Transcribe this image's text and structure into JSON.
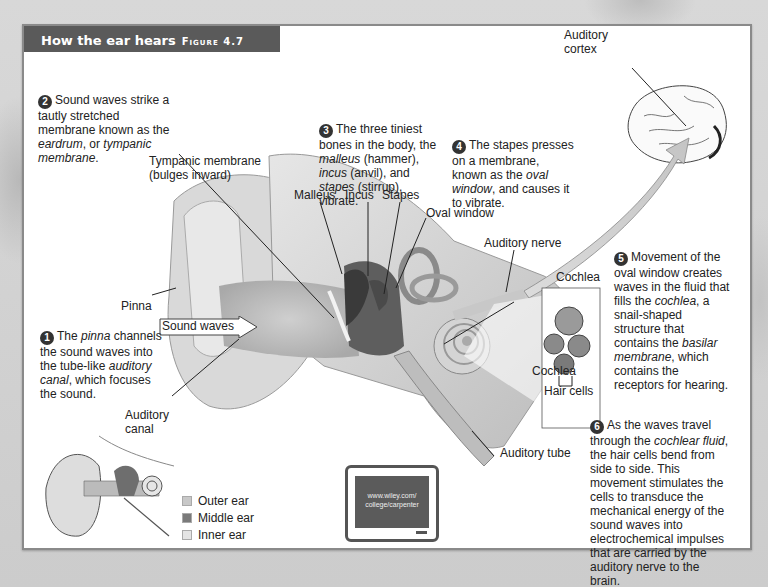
{
  "header": {
    "title": "How the ear hears",
    "figure": "Figure 4.7"
  },
  "callouts": [
    {
      "num": "1",
      "parts": [
        "The ",
        "pinna",
        " channels the sound waves into the tube-like ",
        "auditory canal",
        ", which focuses the sound."
      ]
    },
    {
      "num": "2",
      "parts": [
        "Sound waves strike a tautly stretched membrane known as the ",
        "eardrum",
        ", or ",
        "tympanic membrane",
        "."
      ]
    },
    {
      "num": "3",
      "parts": [
        "The three tiniest bones in the body, the ",
        "malleus",
        " (hammer), ",
        "incus",
        " (anvil), and ",
        "stapes",
        " (stirrup), vibrate."
      ]
    },
    {
      "num": "4",
      "parts": [
        "The stapes presses on a membrane, known as the ",
        "oval window",
        ", and causes it to vibrate."
      ]
    },
    {
      "num": "5",
      "parts": [
        "Movement of the oval window creates waves in the fluid that fills the ",
        "cochlea",
        ", a snail-shaped structure that contains the ",
        "basilar membrane",
        ", which contains the receptors for hearing."
      ]
    },
    {
      "num": "6",
      "parts": [
        "As the waves travel through the ",
        "cochlear fluid",
        ", the hair cells bend from side to side. This movement stimulates the cells to transduce the mechanical energy of the sound waves into electrochemical impulses that are carried by the auditory nerve to the brain."
      ]
    }
  ],
  "labels": {
    "auditory_cortex_1": "Auditory",
    "auditory_cortex_2": "cortex",
    "tympanic_1": "Tympanic membrane",
    "tympanic_2": "(bulges inward)",
    "malleus": "Malleus",
    "incus": "Incus",
    "stapes": "Stapes",
    "oval_window": "Oval window",
    "auditory_nerve": "Auditory nerve",
    "cochlea_top": "Cochlea",
    "cochlea_inset": "Cochlea",
    "hair_cells": "Hair cells",
    "pinna": "Pinna",
    "sound_waves": "Sound waves",
    "auditory_canal_1": "Auditory",
    "auditory_canal_2": "canal",
    "auditory_tube": "Auditory tube"
  },
  "legend": [
    {
      "label": "Outer ear",
      "color": "#c8c8c8"
    },
    {
      "label": "Middle ear",
      "color": "#7a7a7a"
    },
    {
      "label": "Inner ear",
      "color": "#e4e4e4"
    }
  ],
  "monitor": {
    "line1": "www.wiley.com/",
    "line2": "college/carpenter"
  },
  "colors": {
    "title_bar": "#5a5a5a",
    "frame_border": "#8a8a8a",
    "number_badge": "#333333"
  }
}
